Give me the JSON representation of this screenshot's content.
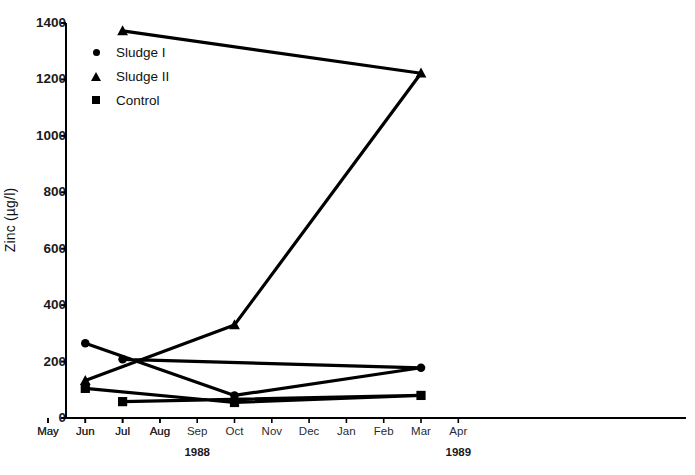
{
  "chart_data": {
    "type": "line",
    "title": "",
    "xlabel": "",
    "ylabel": "Zinc (µg/l)",
    "ylim": [
      0,
      1400
    ],
    "yticks": [
      0,
      200,
      400,
      600,
      800,
      1000,
      1200,
      1400
    ],
    "grid": false,
    "legend_position": "top-left",
    "categories": [
      "May",
      "Jun",
      "Jul",
      "Aug",
      "Sep",
      "Oct",
      "Nov",
      "Dec",
      "Jan",
      "Feb",
      "Mar",
      "Apr",
      "May",
      "Jun",
      "Jul",
      "Aug"
    ],
    "year_groups": [
      {
        "label": "1988",
        "center_category": "Sep"
      },
      {
        "label": "1989",
        "center_category": "Apr"
      }
    ],
    "series": [
      {
        "name": "Sludge I",
        "marker": "circle",
        "x": [
          "Jun",
          "Oct",
          "Mar",
          "Jul"
        ],
        "values": [
          265,
          80,
          178,
          208
        ]
      },
      {
        "name": "Sludge II",
        "marker": "triangle",
        "x": [
          "Jun",
          "Oct",
          "Mar",
          "Jul"
        ],
        "values": [
          133,
          330,
          1222,
          1372
        ]
      },
      {
        "name": "Control",
        "marker": "square",
        "x": [
          "Jun",
          "Oct",
          "Mar",
          "Jul"
        ],
        "values": [
          105,
          55,
          80,
          58
        ]
      }
    ]
  },
  "legend": {
    "items": [
      {
        "label": "Sludge I",
        "marker": "circle"
      },
      {
        "label": "Sludge II",
        "marker": "triangle"
      },
      {
        "label": "Control",
        "marker": "square"
      }
    ]
  },
  "axes": {
    "y_title": "Zinc (µg/l)",
    "y_tick_labels": [
      "1400",
      "1200",
      "1000",
      "800",
      "600",
      "400",
      "200",
      "0"
    ],
    "x_tick_labels": [
      "May",
      "Jun",
      "Jul",
      "Aug",
      "Sep",
      "Oct",
      "Nov",
      "Dec",
      "Jan",
      "Feb",
      "Mar",
      "Apr",
      "May",
      "Jun",
      "Jul",
      "Aug"
    ],
    "year_labels": [
      "1988",
      "1989"
    ]
  },
  "colors": {
    "ink": "#000000",
    "background": "#ffffff"
  }
}
